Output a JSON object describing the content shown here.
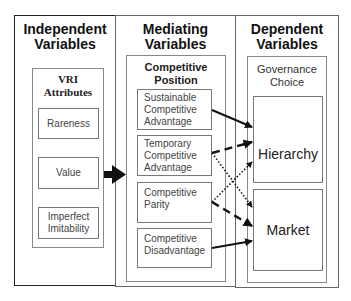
{
  "columns": {
    "independent": {
      "title_line1": "Independent",
      "title_line2": "Variables",
      "group_line1": "VRI",
      "group_line2": "Attributes",
      "items": [
        {
          "line1": "Rareness",
          "line2": ""
        },
        {
          "line1": "Value",
          "line2": ""
        },
        {
          "line1": "Imperfect",
          "line2": "Imitability"
        }
      ]
    },
    "mediating": {
      "title_line1": "Mediating",
      "title_line2": "Variables",
      "group_line1": "Competitive",
      "group_line2": "Position",
      "items": [
        {
          "line1": "Sustainable",
          "line2": "Competitive",
          "line3": "Advantage"
        },
        {
          "line1": "Temporary",
          "line2": "Competitive",
          "line3": "Advantage"
        },
        {
          "line1": "Competitive",
          "line2": "Parity",
          "line3": ""
        },
        {
          "line1": "Competitive",
          "line2": "Disadvantage",
          "line3": ""
        }
      ]
    },
    "dependent": {
      "title_line1": "Dependent",
      "title_line2": "Variables",
      "group_line1": "Governance",
      "group_line2": "Choice",
      "items": [
        {
          "label": "Hierarchy"
        },
        {
          "label": "Market"
        }
      ]
    }
  },
  "connections": [
    {
      "from": "VRI Attributes",
      "to": "Competitive Position",
      "style": "solid-thick"
    },
    {
      "from": "Sustainable Competitive Advantage",
      "to": "Hierarchy",
      "style": "solid"
    },
    {
      "from": "Temporary Competitive Advantage",
      "to": "Hierarchy",
      "style": "dashed"
    },
    {
      "from": "Temporary Competitive Advantage",
      "to": "Market",
      "style": "dotted"
    },
    {
      "from": "Competitive Parity",
      "to": "Hierarchy",
      "style": "dotted"
    },
    {
      "from": "Competitive Parity",
      "to": "Market",
      "style": "dashed"
    },
    {
      "from": "Competitive Disadvantage",
      "to": "Market",
      "style": "solid"
    }
  ]
}
